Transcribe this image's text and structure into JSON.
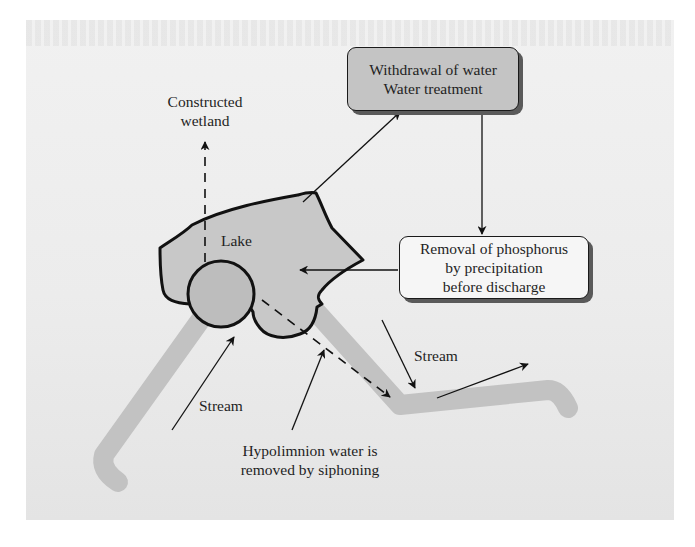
{
  "diagram": {
    "colors": {
      "page_background": "#ffffff",
      "panel_background": "#ececec",
      "lake_fill": "#c8c8c8",
      "circle_fill": "#bdbdbd",
      "stream_color": "#c2c2c2",
      "outline": "#1a1a1a",
      "box_withdrawal_fill": "#c4c4c4",
      "box_removal_fill": "#f6f6f6",
      "box_shadow": "#5a5a5a"
    },
    "nodes": {
      "withdrawal_box": {
        "line1": "Withdrawal of water",
        "line2": "Water treatment"
      },
      "removal_box": {
        "line1": "Removal of phosphorus",
        "line2": "by precipitation",
        "line3": "before discharge"
      },
      "lake_label": "Lake",
      "wetland_label": {
        "line1": "Constructed",
        "line2": "wetland"
      },
      "stream_inflow_label": "Stream",
      "stream_outflow_label": "Stream",
      "hypolimnion_label": {
        "line1": "Hypolimnion water is",
        "line2": "removed by siphoning"
      }
    },
    "edges": [
      {
        "from": "lake",
        "to": "withdrawal_box",
        "style": "solid"
      },
      {
        "from": "withdrawal_box",
        "to": "removal_box",
        "style": "solid"
      },
      {
        "from": "removal_box",
        "to": "lake",
        "style": "solid"
      },
      {
        "from": "lake",
        "to": "constructed_wetland",
        "style": "dashed"
      },
      {
        "from": "lake_hypolimnion",
        "to": "outflow_stream",
        "style": "dashed"
      },
      {
        "from": "inflow_stream",
        "to": "lake",
        "style": "solid"
      },
      {
        "from": "hypolimnion_label",
        "to": "siphon",
        "style": "solid"
      },
      {
        "from": "outflow_stream_label",
        "to": "outflow_stream",
        "style": "solid"
      },
      {
        "from": "outflow_stream",
        "to": "downstream",
        "style": "solid"
      }
    ]
  }
}
